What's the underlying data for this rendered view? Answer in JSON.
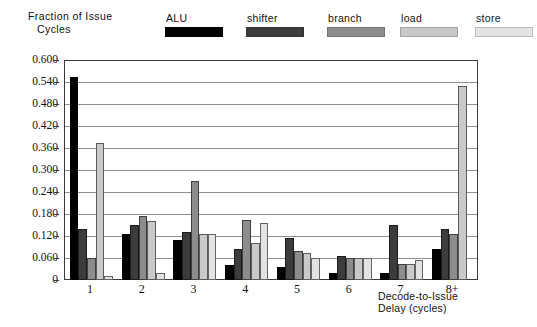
{
  "chart_data": {
    "type": "bar",
    "title": "",
    "subtitle": "",
    "ylabel_line1": "Fraction of Issue",
    "ylabel_line2": "Cycles",
    "xlabel_line1": "Decode-to-Issue",
    "xlabel_line2": "Delay (cycles)",
    "categories": [
      "1",
      "2",
      "3",
      "4",
      "5",
      "6",
      "7",
      "8+"
    ],
    "ylim": [
      0,
      0.6
    ],
    "ytick_labels": [
      "0.600",
      "0.540",
      "0.480",
      "0.420",
      "0.360",
      "0.300",
      "0.240",
      "0.180",
      "0.120",
      "0.060",
      "0"
    ],
    "ytick_values": [
      0.6,
      0.54,
      0.48,
      0.42,
      0.36,
      0.3,
      0.24,
      0.18,
      0.12,
      0.06,
      0
    ],
    "grid": true,
    "grid_axis": "y",
    "legend_position": "top",
    "series": [
      {
        "name": "ALU",
        "color": "#000000",
        "values": [
          0.555,
          0.125,
          0.11,
          0.04,
          0.035,
          0.02,
          0.02,
          0.085
        ]
      },
      {
        "name": "shifter",
        "color": "#3c3c3c",
        "values": [
          0.14,
          0.15,
          0.13,
          0.085,
          0.115,
          0.065,
          0.15,
          0.14
        ]
      },
      {
        "name": "branch",
        "color": "#8c8c8c",
        "values": [
          0.06,
          0.175,
          0.27,
          0.165,
          0.08,
          0.06,
          0.045,
          0.125
        ]
      },
      {
        "name": "load",
        "color": "#c9c9c9",
        "values": [
          0.375,
          0.16,
          0.125,
          0.1,
          0.075,
          0.06,
          0.045,
          0.53
        ]
      },
      {
        "name": "store",
        "color": "#e3e3e3",
        "values": [
          0.01,
          0.02,
          0.125,
          0.155,
          0.06,
          0.06,
          0.055,
          0.0
        ]
      }
    ]
  },
  "legend": {
    "items": [
      {
        "label": "ALU",
        "swatch_name": "legend-swatch-alu"
      },
      {
        "label": "shifter",
        "swatch_name": "legend-swatch-shifter"
      },
      {
        "label": "branch",
        "swatch_name": "legend-swatch-branch"
      },
      {
        "label": "load",
        "swatch_name": "legend-swatch-load"
      },
      {
        "label": "store",
        "swatch_name": "legend-swatch-store"
      }
    ]
  }
}
